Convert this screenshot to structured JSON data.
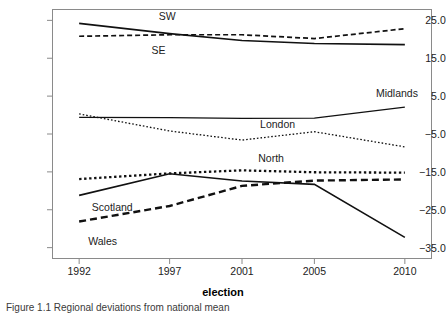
{
  "figure": {
    "caption": "Figure 1.1 Regional deviations from national mean",
    "xaxis_title": "election"
  },
  "chart_data": {
    "type": "line",
    "title": "",
    "xlabel": "election",
    "ylabel": "",
    "x": [
      1992,
      1997,
      2001,
      2005,
      2010
    ],
    "xticklabels": [
      "1992",
      "1997",
      "2001",
      "2005",
      "2010"
    ],
    "yticks": [
      25.0,
      15.0,
      5.0,
      -5.0,
      -15.0,
      -25.0,
      -35.0
    ],
    "yticklabels": [
      "25.0",
      "15.0",
      "5.0",
      "-5.0",
      "-15.0",
      "-25.0",
      "-35.0"
    ],
    "ylim": [
      -38.0,
      28.0
    ],
    "xlim": [
      1990.5,
      2011.5
    ],
    "grid": false,
    "legend": "inline-labels",
    "series": [
      {
        "name": "SE",
        "style": "solid",
        "values": [
          24.2,
          21.5,
          19.7,
          18.9,
          18.6
        ]
      },
      {
        "name": "SW",
        "style": "dashed",
        "values": [
          20.8,
          21.2,
          21.2,
          20.2,
          22.8
        ]
      },
      {
        "name": "Midlands",
        "style": "solid-thin",
        "values": [
          -0.6,
          -0.7,
          -0.9,
          -0.8,
          2.1
        ]
      },
      {
        "name": "London",
        "style": "dotted-fine",
        "values": [
          0.3,
          -4.2,
          -6.6,
          -4.4,
          -8.4
        ]
      },
      {
        "name": "North",
        "style": "dotted-heavy",
        "values": [
          -16.9,
          -15.4,
          -14.6,
          -15.1,
          -15.2
        ]
      },
      {
        "name": "Scotland",
        "style": "solid",
        "values": [
          -21.2,
          -15.5,
          -17.4,
          -18.3,
          -32.3
        ]
      },
      {
        "name": "Wales",
        "style": "dashed-heavy",
        "values": [
          -28.1,
          -24.0,
          -18.7,
          -17.3,
          -17.0
        ]
      }
    ],
    "annotations": [
      {
        "text": "SW",
        "x": 1996.4,
        "y": 26.0
      },
      {
        "text": "SE",
        "x": 1996.0,
        "y": 16.8
      },
      {
        "text": "Midlands",
        "x": 2008.4,
        "y": 5.6
      },
      {
        "text": "London",
        "x": 2002.0,
        "y": -2.6
      },
      {
        "text": "North",
        "x": 2001.9,
        "y": -11.6
      },
      {
        "text": "Scotland",
        "x": 1992.7,
        "y": -24.6
      },
      {
        "text": "Wales",
        "x": 1992.5,
        "y": -33.6
      }
    ]
  }
}
